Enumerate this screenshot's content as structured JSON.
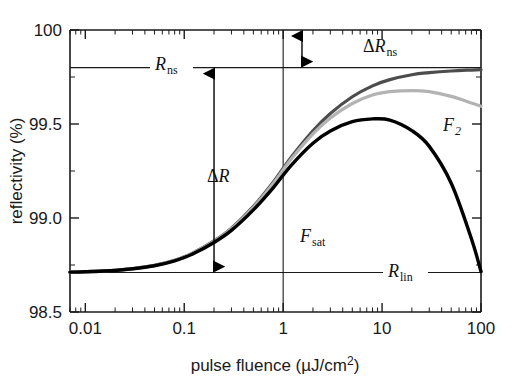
{
  "figure": {
    "name": "sesam-nonlinear-reflectivity-curve",
    "background_color": "#ffffff"
  },
  "chart_data": {
    "type": "line",
    "title": "",
    "xlabel": "pulse fluence (µJ/cm²)",
    "ylabel": "reflectivity (%)",
    "xscale": "log",
    "xlim": [
      0.007,
      100
    ],
    "ylim": [
      98.5,
      100
    ],
    "grid": false,
    "legend_position": "inline-annotation",
    "x_tick_labels": [
      "0.01",
      "0.1",
      "1",
      "10",
      "100"
    ],
    "x_tick_values": [
      0.01,
      0.1,
      1,
      10,
      100
    ],
    "y_tick_labels": [
      "98.5",
      "99.0",
      "99.5",
      "100"
    ],
    "y_tick_values": [
      98.5,
      99.0,
      99.5,
      100.0
    ],
    "reference_lines": [
      {
        "name": "R_ns",
        "label": "R",
        "sub": "ns",
        "orientation": "horizontal",
        "value": 99.8,
        "color": "#1a1a1a"
      },
      {
        "name": "R_lin",
        "label": "R",
        "sub": "lin",
        "orientation": "horizontal",
        "value": 98.71,
        "color": "#1a1a1a"
      },
      {
        "name": "F_sat",
        "label": "F",
        "sub": "sat",
        "orientation": "vertical",
        "value": 1.0,
        "color": "#1a1a1a"
      }
    ],
    "annotations": [
      {
        "name": "delta-R",
        "text": "ΔR",
        "from": 98.71,
        "to": 99.8,
        "at_x": 0.2,
        "kind": "double-arrow"
      },
      {
        "name": "delta-R-ns",
        "text": "ΔR",
        "sub": "ns",
        "from": 99.8,
        "to": 100.0,
        "at_x": 1.55,
        "kind": "double-arrow"
      },
      {
        "name": "F2-label",
        "text": "F",
        "sub": "2",
        "at_x": 33,
        "at_y": 99.52
      }
    ],
    "series": [
      {
        "name": "no-inverse-saturable-absorption",
        "color": "#4d4d4d",
        "linewidth": 3.2,
        "label": "",
        "x": [
          0.007,
          0.01,
          0.02,
          0.03,
          0.05,
          0.08,
          0.12,
          0.2,
          0.3,
          0.5,
          0.8,
          1.2,
          2,
          3,
          5,
          8,
          12,
          20,
          30,
          50,
          80,
          100
        ],
        "y": [
          98.712,
          98.715,
          98.722,
          98.731,
          98.748,
          98.775,
          98.812,
          98.878,
          98.946,
          99.062,
          99.193,
          99.322,
          99.464,
          99.556,
          99.645,
          99.703,
          99.736,
          99.762,
          99.773,
          99.782,
          99.787,
          99.789
        ]
      },
      {
        "name": "weak-two-photon-absorption",
        "color": "#b3b3b3",
        "linewidth": 3.2,
        "label": "",
        "x": [
          0.007,
          0.01,
          0.02,
          0.03,
          0.05,
          0.08,
          0.12,
          0.2,
          0.3,
          0.5,
          0.8,
          1.2,
          2,
          3,
          5,
          8,
          12,
          20,
          30,
          50,
          80,
          100
        ],
        "y": [
          98.712,
          98.715,
          98.722,
          98.731,
          98.748,
          98.774,
          98.811,
          98.876,
          98.943,
          99.057,
          99.186,
          99.312,
          99.447,
          99.532,
          99.609,
          99.654,
          99.672,
          99.678,
          99.672,
          99.647,
          99.612,
          99.594
        ]
      },
      {
        "name": "strong-two-photon-absorption-F2",
        "color": "#000000",
        "linewidth": 3.4,
        "label": "F2",
        "x": [
          0.007,
          0.01,
          0.02,
          0.03,
          0.05,
          0.08,
          0.12,
          0.2,
          0.3,
          0.5,
          0.8,
          1.2,
          2,
          3,
          5,
          8,
          12,
          20,
          30,
          50,
          80,
          100
        ],
        "y": [
          98.712,
          98.714,
          98.721,
          98.73,
          98.746,
          98.772,
          98.807,
          98.87,
          98.934,
          99.043,
          99.163,
          99.279,
          99.398,
          99.463,
          99.512,
          99.527,
          99.521,
          99.465,
          99.381,
          99.185,
          98.89,
          98.715
        ]
      }
    ]
  }
}
